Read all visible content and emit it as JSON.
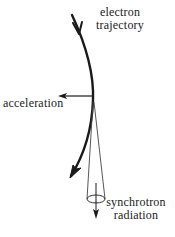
{
  "diagram": {
    "labels": {
      "trajectory_line1": "electron",
      "trajectory_line2": "trajectory",
      "acceleration": "acceleration",
      "radiation_line1": "synchrotron",
      "radiation_line2": "radiation"
    },
    "elements": [
      {
        "id": "electron-trajectory",
        "type": "curved-arrow",
        "description": "curved electron path bending downward-left with arrowheads"
      },
      {
        "id": "acceleration-arrow",
        "type": "arrow",
        "direction": "left",
        "description": "acceleration vector pointing toward center of curvature"
      },
      {
        "id": "radiation-cone",
        "type": "cone",
        "description": "narrow emission cone tangent to trajectory"
      },
      {
        "id": "radiation-arrow",
        "type": "arrow",
        "direction": "down",
        "description": "direction of synchrotron radiation"
      }
    ],
    "colors": {
      "stroke": "#1a1a1a",
      "cone": "#444444",
      "text": "#222222",
      "background": "#ffffff"
    }
  }
}
